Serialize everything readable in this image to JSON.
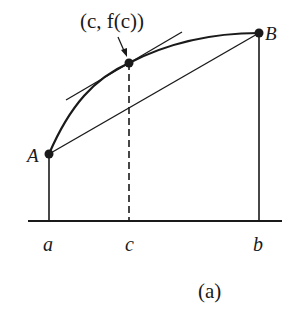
{
  "figure": {
    "caption": "(a)",
    "point_label": "(c, f(c))",
    "points": {
      "A": {
        "label": "A"
      },
      "B": {
        "label": "B"
      }
    },
    "axis_labels": {
      "a": "a",
      "c": "c",
      "b": "b"
    }
  },
  "colors": {
    "stroke": "#1a1a1a",
    "background": "#ffffff"
  }
}
